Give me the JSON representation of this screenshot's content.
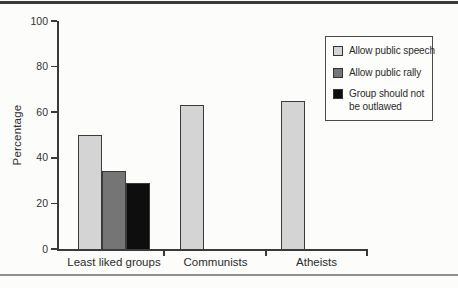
{
  "chart_data": {
    "type": "bar",
    "categories": [
      "Least liked groups",
      "Communists",
      "Atheists"
    ],
    "series": [
      {
        "name": "Allow public speech",
        "color": "#d4d4d4",
        "values": [
          50,
          63,
          65
        ]
      },
      {
        "name": "Allow public rally",
        "color": "#757575",
        "values": [
          34,
          null,
          null
        ]
      },
      {
        "name": "Group should not be outlawed",
        "color": "#0e0e0e",
        "values": [
          29,
          null,
          null
        ]
      }
    ],
    "title": "",
    "xlabel": "",
    "ylabel": "Percentage",
    "ylim": [
      0,
      100
    ],
    "yticks": [
      0,
      20,
      40,
      60,
      80,
      100
    ],
    "grid": false,
    "legend_position": "upper right"
  },
  "legend": {
    "items": [
      {
        "lines": [
          "Allow public speech"
        ]
      },
      {
        "lines": [
          "Allow public rally"
        ]
      },
      {
        "lines": [
          "Group should not",
          "be outlawed"
        ]
      }
    ]
  }
}
